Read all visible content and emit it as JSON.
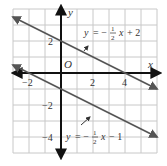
{
  "chart_data": {
    "type": "line",
    "title": "",
    "xlabel": "x",
    "ylabel": "y",
    "origin_label": "O",
    "xlim": [
      -3,
      6
    ],
    "ylim": [
      -5,
      4
    ],
    "grid": true,
    "x_ticks": [
      {
        "value": -2,
        "label": "-2"
      },
      {
        "value": 2,
        "label": "2"
      },
      {
        "value": 4,
        "label": "4"
      }
    ],
    "y_ticks": [
      {
        "value": 2,
        "label": "2"
      },
      {
        "value": -2,
        "label": "-2"
      },
      {
        "value": -4,
        "label": "-4"
      }
    ],
    "series": [
      {
        "name": "y = -1/2 x + 2",
        "slope": -0.5,
        "intercept": 2,
        "x": [
          -3,
          6
        ],
        "y": [
          3.5,
          -1
        ]
      },
      {
        "name": "y = -1/2 x - 1",
        "slope": -0.5,
        "intercept": -1,
        "x": [
          -3,
          6
        ],
        "y": [
          0.5,
          -4
        ]
      }
    ],
    "annotations": [
      {
        "text": "y = -1/2 x + 2",
        "target_series": 0,
        "has_arrow": true
      },
      {
        "text": "y = -1/2 x - 1",
        "target_series": 1,
        "has_arrow": true
      }
    ]
  },
  "colors": {
    "grid": "#c8c8c8",
    "axes": "#111111",
    "lines": "#555555",
    "text": "#333333"
  }
}
